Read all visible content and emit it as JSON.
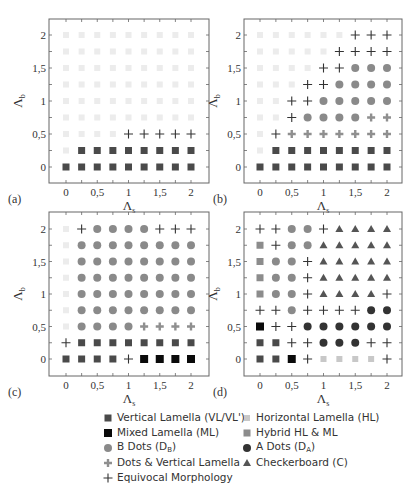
{
  "chart_data": {
    "type": "scatter",
    "title": "",
    "xlabel": "Λs",
    "ylabel": "Λb",
    "xlim": [
      -0.25,
      2.25
    ],
    "ylim": [
      -0.25,
      2.25
    ],
    "x_ticks": [
      0,
      0.25,
      0.5,
      0.75,
      1,
      1.25,
      1.5,
      1.75,
      2
    ],
    "x_tick_labels": [
      "0",
      "",
      "0,5",
      "",
      "1",
      "",
      "1,5",
      "",
      "2"
    ],
    "y_ticks": [
      0,
      0.25,
      0.5,
      0.75,
      1,
      1.25,
      1.5,
      1.75,
      2
    ],
    "y_tick_labels": [
      "0",
      "",
      "0,5",
      "",
      "1",
      "",
      "1,5",
      "",
      "2"
    ],
    "grid": false,
    "legend_position": "bottom",
    "categories_key": {
      "VL": "Vertical Lamella (VL/VL')",
      "ML": "Mixed Lamella (ML)",
      "DB": "B Dots (D_B)",
      "DV": "Dots & Vertical Lamella",
      "EQ": "Equivocal Morphology",
      "HL": "Horizontal Lamella (HL)",
      "HH": "Hybrid HL & ML",
      "DA": "A Dots (D_A)",
      "C": "Checkerboard (C)"
    },
    "row_order_note": "rows listed from Λb=2 (top) to Λb=0 (bottom); columns Λs=0..2 step 0.25",
    "panels": [
      {
        "label": "(a)",
        "rows": [
          [
            "HL",
            "HL",
            "HL",
            "HL",
            "HL",
            "HL",
            "HL",
            "HL",
            "HL"
          ],
          [
            "HL",
            "HL",
            "HL",
            "HL",
            "HL",
            "HL",
            "HL",
            "HL",
            "HL"
          ],
          [
            "HL",
            "HL",
            "HL",
            "HL",
            "HL",
            "HL",
            "HL",
            "HL",
            "HL"
          ],
          [
            "HL",
            "HL",
            "HL",
            "HL",
            "HL",
            "HL",
            "HL",
            "HL",
            "HL"
          ],
          [
            "HL",
            "HL",
            "HL",
            "HL",
            "HL",
            "HL",
            "HL",
            "HL",
            "HL"
          ],
          [
            "HL",
            "HL",
            "HL",
            "HL",
            "HL",
            "HL",
            "HL",
            "HL",
            "HL"
          ],
          [
            "HL",
            "HL",
            "HL",
            "HL",
            "EQ",
            "EQ",
            "EQ",
            "EQ",
            "EQ"
          ],
          [
            "HL",
            "VL",
            "VL",
            "VL",
            "VL",
            "VL",
            "VL",
            "VL",
            "VL"
          ],
          [
            "VL",
            "VL",
            "VL",
            "VL",
            "VL",
            "VL",
            "VL",
            "VL",
            "VL"
          ]
        ]
      },
      {
        "label": "(b)",
        "rows": [
          [
            "HL",
            "HL",
            "HL",
            "HL",
            "HL",
            "HL",
            "EQ",
            "EQ",
            "EQ"
          ],
          [
            "HL",
            "HL",
            "HL",
            "HL",
            "HL",
            "EQ",
            "EQ",
            "EQ",
            "EQ"
          ],
          [
            "HL",
            "HL",
            "HL",
            "HL",
            "EQ",
            "EQ",
            "DB",
            "DB",
            "DB"
          ],
          [
            "HL",
            "HL",
            "HL",
            "EQ",
            "EQ",
            "DB",
            "DB",
            "DB",
            "DB"
          ],
          [
            "HL",
            "HL",
            "EQ",
            "EQ",
            "DB",
            "DB",
            "DB",
            "DB",
            "DB"
          ],
          [
            "HL",
            "HL",
            "EQ",
            "DB",
            "DB",
            "DB",
            "DB",
            "DV",
            "DV"
          ],
          [
            "HL",
            "EQ",
            "DV",
            "DV",
            "DV",
            "DV",
            "DV",
            "DV",
            "DV"
          ],
          [
            "HL",
            "VL",
            "VL",
            "VL",
            "VL",
            "VL",
            "VL",
            "VL",
            "VL"
          ],
          [
            "VL",
            "VL",
            "VL",
            "VL",
            "VL",
            "VL",
            "VL",
            "VL",
            "VL"
          ]
        ]
      },
      {
        "label": "(c)",
        "rows": [
          [
            "HL",
            "EQ",
            "DB",
            "DB",
            "DB",
            "DB",
            "EQ",
            "EQ",
            "EQ"
          ],
          [
            "HL",
            "DB",
            "DB",
            "DB",
            "DB",
            "DB",
            "DB",
            "DB",
            "DB"
          ],
          [
            "HL",
            "DB",
            "DB",
            "DB",
            "DB",
            "DB",
            "DB",
            "DB",
            "DB"
          ],
          [
            "HL",
            "DB",
            "DB",
            "DB",
            "DB",
            "DB",
            "DB",
            "DB",
            "DB"
          ],
          [
            "HL",
            "DB",
            "DB",
            "DB",
            "DB",
            "DB",
            "DB",
            "DB",
            "DB"
          ],
          [
            "HL",
            "DB",
            "DB",
            "DB",
            "DB",
            "DB",
            "DB",
            "DB",
            "DB"
          ],
          [
            "HL",
            "DB",
            "DB",
            "DB",
            "DB",
            "DV",
            "DV",
            "DV",
            "DV"
          ],
          [
            "EQ",
            "VL",
            "VL",
            "VL",
            "VL",
            "VL",
            "VL",
            "VL",
            "VL"
          ],
          [
            "VL",
            "VL",
            "VL",
            "VL",
            "EQ",
            "ML",
            "ML",
            "ML",
            "ML"
          ]
        ]
      },
      {
        "label": "(d)",
        "rows": [
          [
            "EQ",
            "EQ",
            "DB",
            "DB",
            "EQ",
            "C",
            "C",
            "C",
            "C"
          ],
          [
            "HH",
            "EQ",
            "DB",
            "DB",
            "C",
            "C",
            "C",
            "C",
            "C"
          ],
          [
            "HH",
            "DB",
            "DB",
            "EQ",
            "C",
            "C",
            "C",
            "C",
            "C"
          ],
          [
            "HH",
            "DB",
            "DB",
            "EQ",
            "C",
            "C",
            "C",
            "C",
            "C"
          ],
          [
            "HH",
            "DB",
            "DB",
            "EQ",
            "C",
            "C",
            "C",
            "C",
            "EQ"
          ],
          [
            "EQ",
            "EQ",
            "DB",
            "EQ",
            "EQ",
            "EQ",
            "EQ",
            "DA",
            "DA"
          ],
          [
            "ML",
            "EQ",
            "EQ",
            "DA",
            "DA",
            "DA",
            "DA",
            "DA",
            "DA"
          ],
          [
            "VL",
            "VL",
            "EQ",
            "EQ",
            "DA",
            "DA",
            "DA",
            "EQ",
            "EQ"
          ],
          [
            "VL",
            "VL",
            "ML",
            "EQ",
            "HL",
            "HL",
            "HL",
            "HL",
            "EQ"
          ]
        ]
      }
    ]
  },
  "styles": {
    "VL": {
      "shape": "square",
      "color": "#4a4a4a",
      "size": 7
    },
    "ML": {
      "shape": "square",
      "color": "#0a0a0a",
      "size": 8
    },
    "HL": {
      "shape": "square",
      "color": "#c8c8c8",
      "size": 6
    },
    "HL_faint": {
      "shape": "square",
      "color": "#ececec",
      "size": 6
    },
    "HH": {
      "shape": "square",
      "color": "#8c8c8c",
      "size": 7
    },
    "DB": {
      "shape": "circle",
      "color": "#8a8a8a",
      "size": 8
    },
    "DA": {
      "shape": "circle",
      "color": "#333333",
      "size": 8
    },
    "DV": {
      "shape": "diamond",
      "color": "#8f8f8f",
      "size": 8
    },
    "EQ": {
      "shape": "plus",
      "color": "#333333",
      "size": 9
    },
    "C": {
      "shape": "triangle",
      "color": "#555555",
      "size": 8
    }
  },
  "legend": {
    "items": [
      {
        "key": "VL",
        "label": "Vertical Lamella (VL/VL')",
        "col": 0,
        "row": 0
      },
      {
        "key": "ML",
        "label": "Mixed Lamella (ML)",
        "col": 0,
        "row": 1
      },
      {
        "key": "DB",
        "label": "B Dots (D",
        "sub": "B",
        "tail": ")",
        "col": 0,
        "row": 2
      },
      {
        "key": "DV",
        "label": "Dots & Vertical Lamella",
        "col": 0,
        "row": 3
      },
      {
        "key": "EQ",
        "label": "Equivocal Morphology",
        "col": 0,
        "row": 4
      },
      {
        "key": "HL",
        "label": "Horizontal Lamella (HL)",
        "col": 1,
        "row": 0
      },
      {
        "key": "HH",
        "label": "Hybrid HL & ML",
        "col": 1,
        "row": 1
      },
      {
        "key": "DA",
        "label": "A Dots (D",
        "sub": "A",
        "tail": ")",
        "col": 1,
        "row": 2
      },
      {
        "key": "C",
        "label": "Checkerboard (C)",
        "col": 1,
        "row": 3
      }
    ]
  },
  "layout": {
    "panels": [
      {
        "frame": [
          49,
          19,
          209,
          183
        ],
        "x0": 66,
        "x2": 191,
        "y2": 35,
        "y0": 167,
        "label_pos": [
          8,
          203
        ]
      },
      {
        "frame": [
          244,
          19,
          402,
          183
        ],
        "x0": 260,
        "x2": 387,
        "y2": 35,
        "y0": 167,
        "label_pos": [
          213,
          203
        ]
      },
      {
        "frame": [
          49,
          212,
          209,
          376
        ],
        "x0": 66,
        "x2": 191,
        "y2": 229,
        "y0": 359,
        "label_pos": [
          8,
          396
        ]
      },
      {
        "frame": [
          244,
          212,
          402,
          376
        ],
        "x0": 260,
        "x2": 387,
        "y2": 229,
        "y0": 359,
        "label_pos": [
          213,
          396
        ]
      }
    ]
  }
}
